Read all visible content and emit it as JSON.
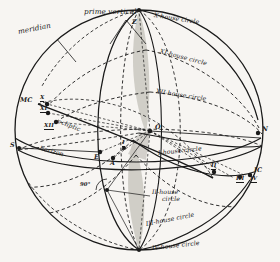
{
  "figure": {
    "type": "astronomical-sphere-diagram",
    "background_color": "#f7f5f2",
    "ink_color": "#1a1a1a",
    "shade_color": "#c9c7c0"
  },
  "great_circles": {
    "meridian": "meridian",
    "prime_vertical": "prime vertical",
    "horizon": "horizon",
    "ecliptic": "ecliptic"
  },
  "house_circles": [
    {
      "id": "x",
      "label": "X-house circle",
      "style": "solid"
    },
    {
      "id": "xi",
      "label": "XI-house circle",
      "style": "dashed"
    },
    {
      "id": "xii",
      "label": "XII-house circle",
      "style": "dashed"
    },
    {
      "id": "i",
      "label": "I-house circle",
      "style": "solid"
    },
    {
      "id": "ii",
      "label": "II-house",
      "label2": "circle",
      "style": "dashed"
    },
    {
      "id": "iii",
      "label": "III-house circle",
      "style": "dashed"
    },
    {
      "id": "iv",
      "label": "IV-house circle",
      "style": "solid"
    }
  ],
  "cardinal_points": {
    "mc": "MC",
    "ic": "IC",
    "south": "S",
    "east": "E",
    "north": "N",
    "center": "O",
    "ascendant": "A",
    "zenith_point": "Z"
  },
  "house_cusps": [
    {
      "label": "X"
    },
    {
      "label": "XI"
    },
    {
      "label": "XII"
    },
    {
      "label": "I"
    },
    {
      "label": "II"
    },
    {
      "label": "III"
    },
    {
      "label": "IV"
    }
  ],
  "angles": {
    "right_angle": "90°"
  }
}
